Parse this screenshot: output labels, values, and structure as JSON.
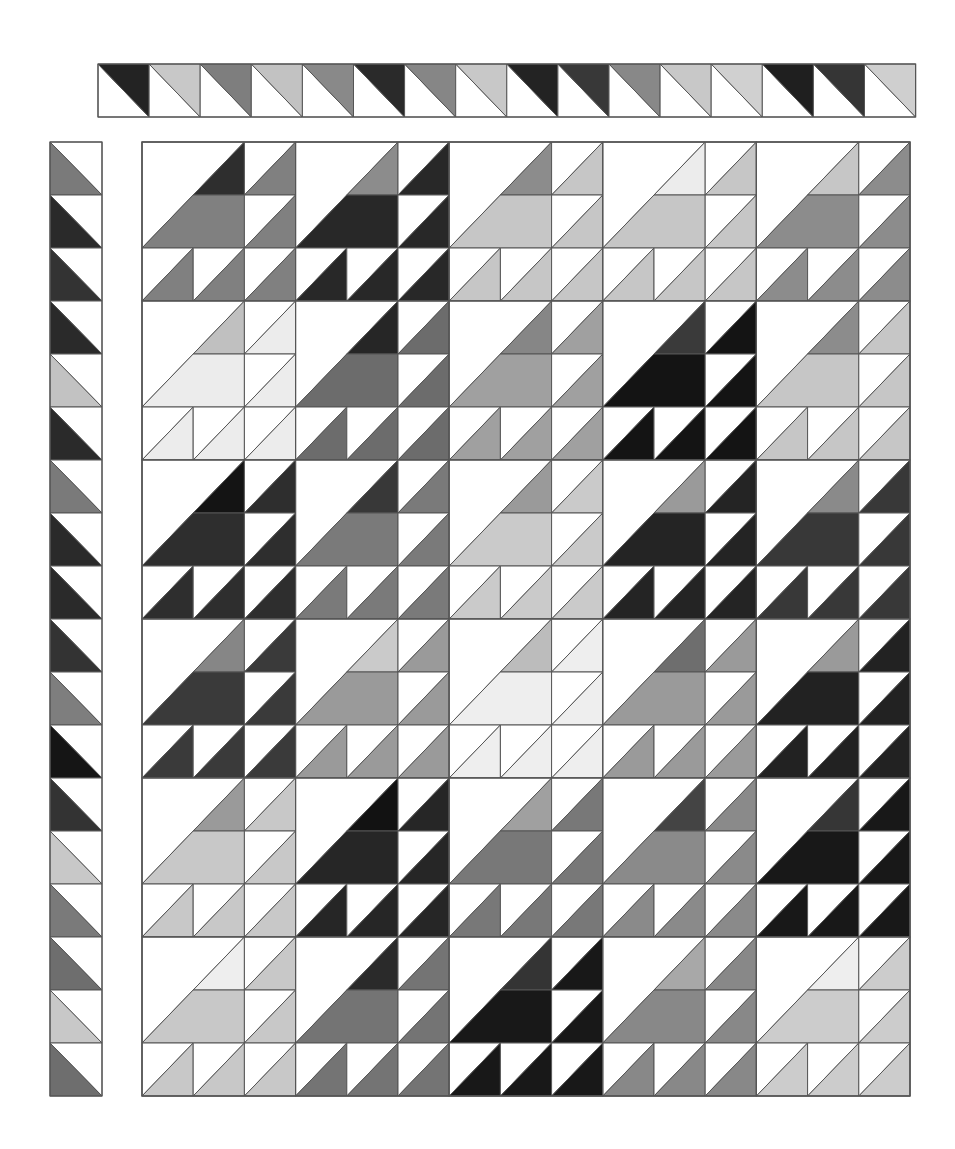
{
  "palette": {
    "white": "#ffffff",
    "outline": "#555555"
  },
  "top_strip": {
    "x": 98,
    "y": 64,
    "cell_w": 51.1,
    "cell_h": 53,
    "orientation": "upper-right triangle colored",
    "cells": [
      "#232323",
      "#c8c8c8",
      "#7e7e7e",
      "#c2c2c2",
      "#898989",
      "#2a2a2a",
      "#868686",
      "#c8c8c8",
      "#232323",
      "#383838",
      "#888888",
      "#c8c8c8",
      "#d0d0d0",
      "#1f1f1f",
      "#353535",
      "#cfcfcf"
    ]
  },
  "left_strip": {
    "x": 50,
    "y": 142,
    "cell_w": 52,
    "cell_h": 53,
    "orientation": "lower-left triangle colored",
    "cells": [
      "#7a7a7a",
      "#2a2a2a",
      "#333333",
      "#2a2a2a",
      "#c2c2c2",
      "#2a2a2a",
      "#7a7a7a",
      "#2a2a2a",
      "#2a2a2a",
      "#333333",
      "#7e7e7e",
      "#151515",
      "#333333",
      "#c8c8c8",
      "#7a7a7a",
      "#6e6e6e",
      "#c8c8c8",
      "#6e6e6e"
    ]
  },
  "main_grid": {
    "x": 142,
    "y": 142,
    "block_w": 153.6,
    "block_h": 159,
    "cols": 5,
    "rows": 6,
    "blocks": [
      [
        {
          "main": "#808080",
          "accent": "#2e2e2e"
        },
        {
          "main": "#282828",
          "accent": "#8c8c8c"
        },
        {
          "main": "#c6c6c6",
          "accent": "#8c8c8c"
        },
        {
          "main": "#c6c6c6",
          "accent": "#ececec"
        },
        {
          "main": "#8c8c8c",
          "accent": "#c6c6c6"
        }
      ],
      [
        {
          "main": "#ececec",
          "accent": "#c0c0c0"
        },
        {
          "main": "#6c6c6c",
          "accent": "#262626"
        },
        {
          "main": "#a0a0a0",
          "accent": "#868686"
        },
        {
          "main": "#141414",
          "accent": "#3a3a3a"
        },
        {
          "main": "#c6c6c6",
          "accent": "#8c8c8c"
        }
      ],
      [
        {
          "main": "#2e2e2e",
          "accent": "#141414"
        },
        {
          "main": "#7a7a7a",
          "accent": "#383838"
        },
        {
          "main": "#cacaca",
          "accent": "#9a9a9a"
        },
        {
          "main": "#242424",
          "accent": "#9a9a9a"
        },
        {
          "main": "#383838",
          "accent": "#8a8a8a"
        }
      ],
      [
        {
          "main": "#3a3a3a",
          "accent": "#868686"
        },
        {
          "main": "#9a9a9a",
          "accent": "#cacaca"
        },
        {
          "main": "#eeeeee",
          "accent": "#bcbcbc"
        },
        {
          "main": "#9a9a9a",
          "accent": "#6e6e6e"
        },
        {
          "main": "#222222",
          "accent": "#9a9a9a"
        }
      ],
      [
        {
          "main": "#c8c8c8",
          "accent": "#9a9a9a"
        },
        {
          "main": "#262626",
          "accent": "#121212"
        },
        {
          "main": "#787878",
          "accent": "#a0a0a0"
        },
        {
          "main": "#8a8a8a",
          "accent": "#444444"
        },
        {
          "main": "#181818",
          "accent": "#363636"
        }
      ],
      [
        {
          "main": "#c8c8c8",
          "accent": "#eeeeee"
        },
        {
          "main": "#747474",
          "accent": "#2a2a2a"
        },
        {
          "main": "#181818",
          "accent": "#343434"
        },
        {
          "main": "#888888",
          "accent": "#a8a8a8"
        },
        {
          "main": "#cccccc",
          "accent": "#eeeeee"
        }
      ]
    ]
  }
}
